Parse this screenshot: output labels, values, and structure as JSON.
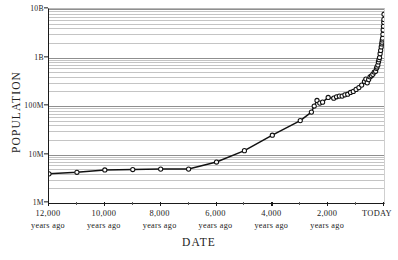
{
  "chart_data": {
    "type": "line",
    "title": "",
    "xlabel": "DATE",
    "ylabel": "POPULATION",
    "x_axis": {
      "scale": "linear",
      "direction": "years-before-present-descending",
      "xlim": [
        12000,
        0
      ],
      "tick_values": [
        12000,
        10000,
        8000,
        6000,
        4000,
        2000,
        0
      ],
      "tick_labels": [
        "12,000",
        "10,000",
        "8,000",
        "6,000",
        "4,000",
        "2,000",
        "TODAY"
      ],
      "tick_sublabel": "years ago",
      "minor_tick_values": [
        11000,
        9000,
        7000,
        5000,
        3000,
        1000
      ],
      "today_has_sublabel": false
    },
    "y_axis": {
      "scale": "log10",
      "ylim": [
        1000000,
        10000000000
      ],
      "tick_values": [
        1000000,
        10000000,
        100000000,
        1000000000,
        10000000000
      ],
      "tick_labels": [
        "1M",
        "10M",
        "100M",
        "1B",
        "10B"
      ],
      "minor_gridlines": true,
      "minor_multipliers": [
        2,
        3,
        4,
        5,
        6,
        7,
        8,
        9
      ]
    },
    "grid": {
      "show": true,
      "color": "#c4c4c4",
      "major_color": "#8f8f8f"
    },
    "legend": {
      "show": false,
      "position": "none"
    },
    "series": [
      {
        "name": "World population",
        "marker": "open-circle",
        "line_color": "#111111",
        "marker_fill": "#ffffff",
        "points": [
          {
            "years_ago": 12000,
            "population": 4000000
          },
          {
            "years_ago": 11000,
            "population": 4300000
          },
          {
            "years_ago": 10000,
            "population": 4800000
          },
          {
            "years_ago": 9000,
            "population": 4900000
          },
          {
            "years_ago": 8000,
            "population": 5000000
          },
          {
            "years_ago": 7000,
            "population": 5000000
          },
          {
            "years_ago": 6000,
            "population": 7000000
          },
          {
            "years_ago": 5000,
            "population": 12000000
          },
          {
            "years_ago": 4000,
            "population": 25000000
          },
          {
            "years_ago": 3000,
            "population": 50000000
          },
          {
            "years_ago": 2600,
            "population": 75000000
          },
          {
            "years_ago": 2500,
            "population": 100000000
          },
          {
            "years_ago": 2400,
            "population": 130000000
          },
          {
            "years_ago": 2300,
            "population": 115000000
          },
          {
            "years_ago": 2200,
            "population": 120000000
          },
          {
            "years_ago": 2000,
            "population": 150000000
          },
          {
            "years_ago": 1800,
            "population": 145000000
          },
          {
            "years_ago": 1700,
            "population": 155000000
          },
          {
            "years_ago": 1600,
            "population": 160000000
          },
          {
            "years_ago": 1500,
            "population": 160000000
          },
          {
            "years_ago": 1400,
            "population": 170000000
          },
          {
            "years_ago": 1300,
            "population": 175000000
          },
          {
            "years_ago": 1200,
            "population": 190000000
          },
          {
            "years_ago": 1100,
            "population": 200000000
          },
          {
            "years_ago": 1000,
            "population": 220000000
          },
          {
            "years_ago": 900,
            "population": 240000000
          },
          {
            "years_ago": 800,
            "population": 270000000
          },
          {
            "years_ago": 700,
            "population": 320000000
          },
          {
            "years_ago": 650,
            "population": 360000000
          },
          {
            "years_ago": 600,
            "population": 300000000
          },
          {
            "years_ago": 550,
            "population": 350000000
          },
          {
            "years_ago": 500,
            "population": 400000000
          },
          {
            "years_ago": 450,
            "population": 420000000
          },
          {
            "years_ago": 400,
            "population": 450000000
          },
          {
            "years_ago": 350,
            "population": 500000000
          },
          {
            "years_ago": 300,
            "population": 520000000
          },
          {
            "years_ago": 270,
            "population": 600000000
          },
          {
            "years_ago": 250,
            "population": 640000000
          },
          {
            "years_ago": 220,
            "population": 700000000
          },
          {
            "years_ago": 200,
            "population": 810000000
          },
          {
            "years_ago": 180,
            "population": 900000000
          },
          {
            "years_ago": 160,
            "population": 1000000000
          },
          {
            "years_ago": 140,
            "population": 1200000000
          },
          {
            "years_ago": 120,
            "population": 1400000000
          },
          {
            "years_ago": 100,
            "population": 1650000000
          },
          {
            "years_ago": 80,
            "population": 1900000000
          },
          {
            "years_ago": 70,
            "population": 2070000000
          },
          {
            "years_ago": 60,
            "population": 2300000000
          },
          {
            "years_ago": 50,
            "population": 2500000000
          },
          {
            "years_ago": 40,
            "population": 3000000000
          },
          {
            "years_ago": 30,
            "population": 3700000000
          },
          {
            "years_ago": 20,
            "population": 4400000000
          },
          {
            "years_ago": 10,
            "population": 5300000000
          },
          {
            "years_ago": 5,
            "population": 6100000000
          },
          {
            "years_ago": 0,
            "population": 7800000000
          }
        ]
      }
    ]
  }
}
